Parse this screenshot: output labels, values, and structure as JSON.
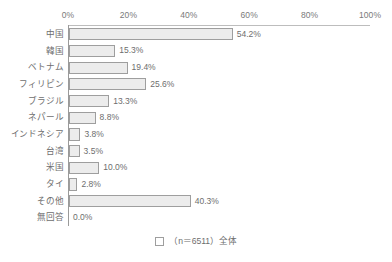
{
  "chart_data": {
    "type": "bar",
    "orientation": "horizontal",
    "title": "",
    "subtitle": "",
    "xlabel": "",
    "ylabel": "",
    "xlim": [
      0,
      100
    ],
    "x_ticks": [
      "0%",
      "20%",
      "40%",
      "60%",
      "80%",
      "100%"
    ],
    "x_tick_values": [
      0,
      20,
      40,
      60,
      80,
      100
    ],
    "grid": false,
    "legend_position": "bottom-center",
    "legend": [
      {
        "label": "（n＝6511）全体",
        "swatch": "#ffffff"
      }
    ],
    "categories": [
      "中国",
      "韓国",
      "ベトナム",
      "フィリピン",
      "ブラジル",
      "ネパール",
      "インドネシア",
      "台湾",
      "米国",
      "タイ",
      "その他",
      "無回答"
    ],
    "values": [
      54.2,
      15.3,
      19.4,
      25.6,
      13.3,
      8.8,
      3.8,
      3.5,
      10.0,
      2.8,
      40.3,
      0.0
    ],
    "value_labels": [
      "54.2%",
      "15.3%",
      "19.4%",
      "25.6%",
      "13.3%",
      "8.8%",
      "3.8%",
      "3.5%",
      "10.0%",
      "2.8%",
      "40.3%",
      "0.0%"
    ],
    "series": [
      {
        "name": "（n＝6511）全体",
        "values": [
          54.2,
          15.3,
          19.4,
          25.6,
          13.3,
          8.8,
          3.8,
          3.5,
          10.0,
          2.8,
          40.3,
          0.0
        ]
      }
    ],
    "n": 6511,
    "colors": {
      "bar_fill": "#ececec",
      "bar_border": "#9e9e9e",
      "text": "#6e6e6e",
      "axis": "#9a9a9a",
      "background": "#ffffff"
    }
  }
}
